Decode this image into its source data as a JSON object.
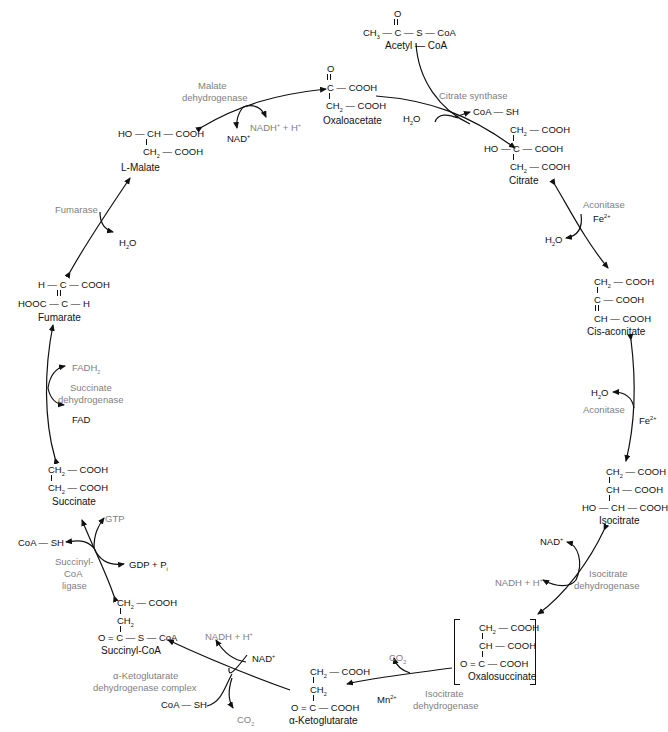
{
  "diagram": {
    "type": "cycle",
    "intermediates": [
      {
        "id": "acetyl_coa",
        "name": "Acetyl — CoA",
        "formula": [
          "O",
          "CH3 — C — S — CoA"
        ]
      },
      {
        "id": "oxaloacetate",
        "name": "Oxaloacetate",
        "formula": [
          "O",
          "C — COOH",
          "CH2 — COOH"
        ]
      },
      {
        "id": "citrate",
        "name": "Citrate",
        "formula": [
          "CH2 — COOH",
          "HO — C — COOH",
          "CH2 — COOH"
        ]
      },
      {
        "id": "cis_aconitate",
        "name": "Cis-aconitate",
        "formula": [
          "CH2 — COOH",
          "C — COOH",
          "CH — COOH"
        ]
      },
      {
        "id": "isocitrate",
        "name": "Isocitrate",
        "formula": [
          "CH2 — COOH",
          "CH — COOH",
          "HO — CH — COOH"
        ]
      },
      {
        "id": "oxalosuccinate",
        "name": "Oxalosuccinate",
        "formula": [
          "CH2 — COOH",
          "CH — COOH",
          "O = C — COOH"
        ]
      },
      {
        "id": "alpha_ketoglutarate",
        "name": "α-Ketoglutarate",
        "formula": [
          "CH2 — COOH",
          "CH2",
          "O = C — COOH"
        ]
      },
      {
        "id": "succinyl_coa",
        "name": "Succinyl-CoA",
        "formula": [
          "CH2 — COOH",
          "CH2",
          "O = C — S — CoA"
        ]
      },
      {
        "id": "succinate",
        "name": "Succinate",
        "formula": [
          "CH2 — COOH",
          "CH2 — COOH"
        ]
      },
      {
        "id": "fumarate",
        "name": "Fumarate",
        "formula": [
          "H — C — COOH",
          "HOOC — C — H"
        ]
      },
      {
        "id": "l_malate",
        "name": "L-Malate",
        "formula": [
          "HO — CH — COOH",
          "CH2 — COOH"
        ]
      }
    ],
    "enzymes": [
      {
        "name": "Citrate synthase",
        "cofactors": [],
        "in": [
          "H2O"
        ],
        "out": [
          "CoA — SH"
        ]
      },
      {
        "name": "Aconitase",
        "cofactors": [
          "Fe2+"
        ],
        "in": [],
        "out": [
          "H2O"
        ]
      },
      {
        "name": "Aconitase",
        "cofactors": [
          "Fe2+"
        ],
        "in": [
          "H2O"
        ],
        "out": []
      },
      {
        "name": "Isocitrate dehydrogenase",
        "cofactors": [],
        "in": [
          "NAD+"
        ],
        "out": [
          "NADH + H+"
        ]
      },
      {
        "name": "Isocitrate dehydrogenase",
        "cofactors": [
          "Mn2+"
        ],
        "in": [],
        "out": [
          "CO2"
        ]
      },
      {
        "name": "α-Ketoglutarate dehydrogenase complex",
        "cofactors": [],
        "in": [
          "NAD+",
          "CoA — SH"
        ],
        "out": [
          "NADH + H+",
          "CO2"
        ]
      },
      {
        "name": "Succinyl-CoA ligase",
        "cofactors": [],
        "in": [
          "GDP + Pi"
        ],
        "out": [
          "GTP",
          "CoA — SH"
        ]
      },
      {
        "name": "Succinate dehydrogenase",
        "cofactors": [],
        "in": [
          "FAD"
        ],
        "out": [
          "FADH2"
        ]
      },
      {
        "name": "Fumarase",
        "cofactors": [],
        "in": [
          "H2O"
        ],
        "out": []
      },
      {
        "name": "Malate dehydrogenase",
        "cofactors": [],
        "in": [
          "NAD+"
        ],
        "out": [
          "NADH+ + H+"
        ]
      }
    ]
  },
  "labels": {
    "acetyl_top_O": "O",
    "acetyl_ch": "CH",
    "acetyl_mid": "— C — S — CoA",
    "acetyl_name": "Acetyl — CoA",
    "oaa_O": "O",
    "oaa_r1": "C — COOH",
    "oaa_ch": "CH",
    "oaa_r2": "— COOH",
    "oaa_name": "Oxaloacetate",
    "cit_ch1": "CH",
    "cit_r1": "— COOH",
    "cit_r2": "HO — C — COOH",
    "cit_ch3": "CH",
    "cit_r3": "— COOH",
    "cit_name": "Citrate",
    "cis_ch1": "CH",
    "cis_r1": "— COOH",
    "cis_r2": "C — COOH",
    "cis_r3": "CH — COOH",
    "cis_name": "Cis-aconitate",
    "iso_ch1": "CH",
    "iso_r1": "— COOH",
    "iso_r2": "CH — COOH",
    "iso_r3": "HO — CH — COOH",
    "iso_name": "Isocitrate",
    "oxs_ch1": "CH",
    "oxs_r1": "— COOH",
    "oxs_r2": "CH — COOH",
    "oxs_r3": "O = C — COOH",
    "oxs_name": "Oxalosuccinate",
    "akg_ch1": "CH",
    "akg_r1": "— COOH",
    "akg_ch2": "CH",
    "akg_r3": "O = C — COOH",
    "akg_name": "α-Ketoglutarate",
    "scoa_ch1": "CH",
    "scoa_r1": "— COOH",
    "scoa_ch2": "CH",
    "scoa_r3": "O = C — S — CoA",
    "scoa_name": "Succinyl-CoA",
    "suc_ch1": "CH",
    "suc_r1": "— COOH",
    "suc_ch2": "CH",
    "suc_r2": "— COOH",
    "suc_name": "Succinate",
    "fum_r1": "H — C — COOH",
    "fum_r2": "HOOC — C — H",
    "fum_name": "Fumarate",
    "mal_r1": "HO — CH — COOH",
    "mal_ch": "CH",
    "mal_r2": "— COOH",
    "mal_name": "L-Malate",
    "sub2": "2",
    "sub3": "3",
    "sup_plus": "+",
    "sup_fe": "2+",
    "sup_mn": "2+",
    "e_citrate_synthase": "Citrate synthase",
    "coa_sh_1": "CoA — SH",
    "h2o_1": "H",
    "h2o_1b": "O",
    "e_aconitase_1": "Aconitase",
    "fe_1": "Fe",
    "h2o_2": "H",
    "h2o_2b": "O",
    "e_aconitase_2": "Aconitase",
    "fe_2": "Fe",
    "h2o_3": "H",
    "h2o_3b": "O",
    "nad_1": "NAD",
    "nadh_1": "NADH + H",
    "e_icdh_1a": "Isocitrate",
    "e_icdh_1b": "dehydrogenase",
    "co2_1": "CO",
    "mn": "Mn",
    "e_icdh_2a": "Isocitrate",
    "e_icdh_2b": "dehydrogenase",
    "nadh_2": "NADH + H",
    "nad_2": "NAD",
    "e_akgdh_a": "α-Ketoglutarate",
    "e_akgdh_b": "dehydrogenase complex",
    "coa_sh_2": "CoA — SH",
    "co2_2": "CO",
    "gtp": "GTP",
    "coa_sh_3": "CoA — SH",
    "gdp": "GDP + P",
    "gdp_sub": "i",
    "e_scl_a": "Succinyl-",
    "e_scl_b": "CoA",
    "e_scl_c": "ligase",
    "fadh2": "FADH",
    "e_sdh_a": "Succinate",
    "e_sdh_b": "dehydrogenase",
    "fad": "FAD",
    "e_fumarase": "Fumarase",
    "h2o_4": "H",
    "h2o_4b": "O",
    "e_mdh_a": "Malate",
    "e_mdh_b": "dehydrogenase",
    "nad_3": "NAD",
    "nadh_3": "NADH",
    "nadh_3b": " + H"
  },
  "colors": {
    "ink": "#111111",
    "enzyme_gray": "#808080",
    "background": "#ffffff"
  }
}
